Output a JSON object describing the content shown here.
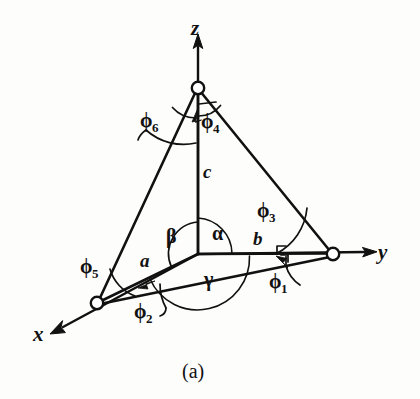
{
  "figure": {
    "caption": "(a)",
    "background_color": "#fdfdfc",
    "ink_color": "#111111",
    "axes": [
      {
        "name": "z",
        "label": "z",
        "label_x": 191,
        "label_y": 16,
        "direction": "up"
      },
      {
        "name": "y",
        "label": "y",
        "label_x": 378,
        "label_y": 240,
        "direction": "right"
      },
      {
        "name": "x",
        "label": "x",
        "label_x": 33,
        "label_y": 322,
        "direction": "down-left"
      }
    ],
    "cell_edges": [
      {
        "name": "a",
        "label": "a",
        "label_x": 140,
        "label_y": 250
      },
      {
        "name": "b",
        "label": "b",
        "label_x": 253,
        "label_y": 228
      },
      {
        "name": "c",
        "label": "c",
        "label_x": 203,
        "label_y": 161
      }
    ],
    "cell_angles": [
      {
        "name": "alpha",
        "label": "α",
        "label_x": 212,
        "label_y": 222
      },
      {
        "name": "beta",
        "label": "β",
        "label_x": 166,
        "label_y": 225
      },
      {
        "name": "gamma",
        "label": "γ",
        "label_x": 204,
        "label_y": 268
      }
    ],
    "phi_angles": [
      {
        "name": "phi1",
        "base": "ϕ",
        "sub": "1",
        "label_x": 269,
        "label_y": 270
      },
      {
        "name": "phi2",
        "base": "ϕ",
        "sub": "2",
        "label_x": 134,
        "label_y": 300
      },
      {
        "name": "phi3",
        "base": "ϕ",
        "sub": "3",
        "label_x": 257,
        "label_y": 199
      },
      {
        "name": "phi4",
        "base": "ϕ",
        "sub": "4",
        "label_x": 201,
        "label_y": 110
      },
      {
        "name": "phi5",
        "base": "ϕ",
        "sub": "5",
        "label_x": 80,
        "label_y": 255
      },
      {
        "name": "phi6",
        "base": "ϕ",
        "sub": "6",
        "label_x": 140,
        "label_y": 109
      }
    ],
    "nodes": [
      {
        "name": "origin",
        "x": 198,
        "y": 254,
        "drawn": false
      },
      {
        "name": "z-node",
        "x": 198,
        "y": 88,
        "drawn": true
      },
      {
        "name": "y-node",
        "x": 333,
        "y": 254,
        "drawn": true
      },
      {
        "name": "x-node",
        "x": 97,
        "y": 303,
        "drawn": true
      }
    ]
  }
}
